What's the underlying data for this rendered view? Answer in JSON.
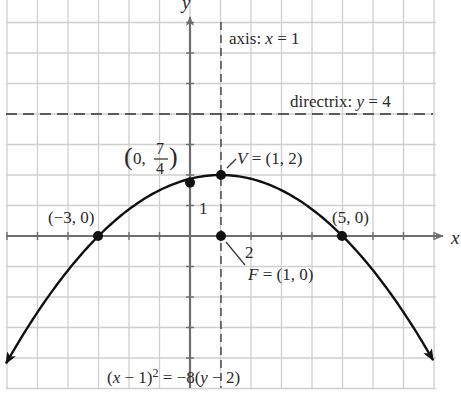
{
  "chart_data": {
    "type": "line",
    "title": "",
    "xlabel": "x",
    "ylabel": "y",
    "xlim": [
      -6,
      8
    ],
    "ylim": [
      -4.5,
      7
    ],
    "grid": true,
    "grid_step": 1,
    "tick_labels": {
      "x": [
        "2"
      ],
      "y": [
        "1"
      ]
    },
    "equation": "(x − 1)² = −8(y − 2)",
    "series": [
      {
        "name": "parabola",
        "function": "y = 2 - (x-1)^2/8",
        "x": [
          -6,
          -5,
          -4,
          -3,
          -2,
          -1,
          0,
          1,
          2,
          3,
          4,
          5,
          6,
          7,
          8
        ],
        "y": [
          -4.125,
          -2.5,
          -1.125,
          0,
          0.875,
          1.5,
          1.75,
          2,
          1.75,
          1.5,
          0.875,
          0,
          -1.125,
          -2.5,
          -4.125
        ]
      }
    ],
    "lines": [
      {
        "name": "axis of symmetry",
        "type": "vertical",
        "x": 1,
        "style": "dashed",
        "label": "axis: x = 1"
      },
      {
        "name": "directrix",
        "type": "horizontal",
        "y": 4,
        "style": "dashed",
        "label": "directrix: y = 4"
      }
    ],
    "points": [
      {
        "name": "vertex",
        "x": 1,
        "y": 2,
        "label": "V = (1, 2)"
      },
      {
        "name": "focus",
        "x": 1,
        "y": 0,
        "label": "F = (1, 0)"
      },
      {
        "name": "y-intercept",
        "x": 0,
        "y": 1.75,
        "label": "(0, 7/4)"
      },
      {
        "name": "x-intercept-left",
        "x": -3,
        "y": 0,
        "label": "(−3, 0)"
      },
      {
        "name": "x-intercept-right",
        "x": 5,
        "y": 0,
        "label": "(5, 0)"
      }
    ]
  },
  "labels": {
    "x_axis": "x",
    "y_axis": "y",
    "axis_prefix": "axis: ",
    "axis_var": "x",
    "axis_eq": " = 1",
    "directrix_prefix": "directrix: ",
    "directrix_var": "y",
    "directrix_eq": " = 4",
    "yint_open": "(0, ",
    "yint_num": "7",
    "yint_den": "4",
    "yint_close": ")",
    "vertex_var": "V",
    "vertex_eq": " = (1, 2)",
    "focus_var": "F",
    "focus_eq": " = (1, 0)",
    "left_int": "(−3, 0)",
    "right_int": "(5, 0)",
    "tick_x2": "2",
    "tick_y1": "1",
    "eq_p1": "(",
    "eq_x": "x",
    "eq_p2": " − 1)",
    "eq_sup": "2",
    "eq_p3": " = −8(",
    "eq_y": "y",
    "eq_p4": " − 2)"
  },
  "colors": {
    "grid": "#cfcfcf",
    "axis": "#6e6e6e",
    "curve": "#111111",
    "dashed": "#333333",
    "text": "#2a2a2a"
  }
}
